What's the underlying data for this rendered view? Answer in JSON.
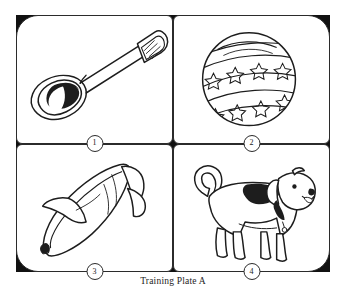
{
  "plate": {
    "caption": "Training Plate A",
    "background_color": "#ffffff",
    "frame_color": "#111111",
    "line_color": "#2b2b2b",
    "panels": [
      {
        "number": "1",
        "item": "spoon",
        "icon": "spoon-icon",
        "position": "top-left"
      },
      {
        "number": "2",
        "item": "ball",
        "icon": "ball-icon",
        "position": "top-right"
      },
      {
        "number": "3",
        "item": "banana",
        "icon": "banana-icon",
        "position": "bottom-left"
      },
      {
        "number": "4",
        "item": "dog",
        "icon": "dog-icon",
        "position": "bottom-right"
      }
    ]
  }
}
